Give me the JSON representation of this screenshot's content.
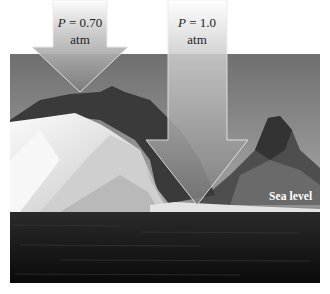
{
  "figure": {
    "arrows": [
      {
        "id": "left",
        "label_var": "P",
        "label_eq": " = 0.70",
        "label_unit": "atm",
        "tip": "mountain top"
      },
      {
        "id": "right",
        "label_var": "P",
        "label_eq": " = 1.0",
        "label_unit": "atm",
        "tip": "sea level"
      }
    ],
    "annotation": "Sea level"
  },
  "colors": {
    "arrow_fill_top": "#f4f4f4",
    "arrow_fill_bottom": "#8a8a8a",
    "arrow_stroke": "#e6e6e6",
    "sky": "#8c8c8c",
    "sea": "#121212"
  }
}
